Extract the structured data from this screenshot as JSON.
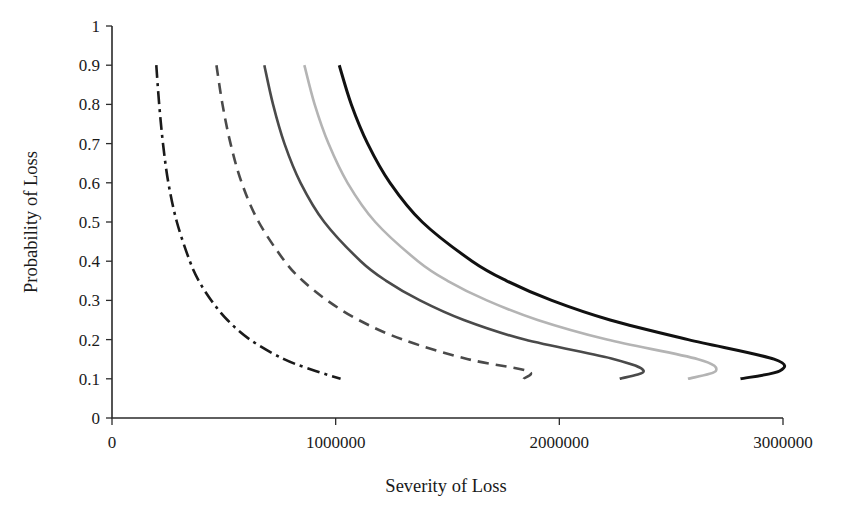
{
  "chart_data": {
    "type": "line",
    "title": "",
    "subtitle": "",
    "xlabel": "Severity of Loss",
    "ylabel": "Probability of Loss",
    "xlim": [
      0,
      3000000
    ],
    "ylim": [
      0,
      1
    ],
    "grid": false,
    "legend": "none",
    "x_ticks": [
      0,
      1000000,
      2000000,
      3000000
    ],
    "x_tick_labels": [
      "0",
      "1000000",
      "2000000",
      "3000000"
    ],
    "y_ticks": [
      0,
      0.1,
      0.2,
      0.3,
      0.4,
      0.5,
      0.6,
      0.7,
      0.8,
      0.9,
      1
    ],
    "y_tick_labels": [
      "0",
      "0.1",
      "0.2",
      "0.3",
      "0.4",
      "0.5",
      "0.6",
      "0.7",
      "0.8",
      "0.9",
      "1"
    ],
    "note": "Five iso-expected-loss curves: probability of loss decreasing hyperbolically with severity of loss. Each curve spans probability 0.9 down to 0.1.",
    "series": [
      {
        "name": "curve-1",
        "style": "dash-dot",
        "color": "#1a1a1a",
        "width": 2.6,
        "dasharray": "13,5,3,5",
        "probability": [
          0.9,
          0.8,
          0.7,
          0.6,
          0.5,
          0.4,
          0.35,
          0.3,
          0.25,
          0.2,
          0.15,
          0.12,
          0.1
        ],
        "severity": [
          198000,
          211000,
          228000,
          252000,
          290000,
          348000,
          388000,
          444000,
          516000,
          617000,
          769000,
          910000,
          1022000
        ]
      },
      {
        "name": "curve-2",
        "style": "dashed",
        "color": "#4a4a4a",
        "width": 2.6,
        "dasharray": "11,7",
        "probability": [
          0.9,
          0.8,
          0.7,
          0.6,
          0.5,
          0.4,
          0.35,
          0.3,
          0.25,
          0.2,
          0.15,
          0.12,
          0.1
        ],
        "severity": [
          467000,
          494000,
          530000,
          580000,
          656000,
          772000,
          853000,
          962000,
          1103000,
          1300000,
          1592000,
          1858000,
          1840000
        ]
      },
      {
        "name": "curve-3",
        "style": "solid",
        "color": "#4a4a4a",
        "width": 2.6,
        "dasharray": "none",
        "probability": [
          0.9,
          0.8,
          0.7,
          0.6,
          0.5,
          0.4,
          0.35,
          0.3,
          0.25,
          0.2,
          0.15,
          0.12,
          0.1
        ],
        "severity": [
          681000,
          720000,
          771000,
          843000,
          949000,
          1112000,
          1226000,
          1377000,
          1573000,
          1845000,
          2245000,
          2377000,
          2270000
        ]
      },
      {
        "name": "curve-4",
        "style": "solid",
        "color": "#b4b4b4",
        "width": 2.6,
        "dasharray": "none",
        "probability": [
          0.9,
          0.8,
          0.7,
          0.6,
          0.5,
          0.4,
          0.35,
          0.3,
          0.25,
          0.2,
          0.15,
          0.12,
          0.1
        ],
        "severity": [
          860000,
          906000,
          968000,
          1053000,
          1177000,
          1368000,
          1500000,
          1676000,
          1903000,
          2213000,
          2620000,
          2700000,
          2575000
        ]
      },
      {
        "name": "curve-5",
        "style": "solid",
        "color": "#111111",
        "width": 3.0,
        "dasharray": "none",
        "probability": [
          0.9,
          0.8,
          0.7,
          0.6,
          0.5,
          0.4,
          0.35,
          0.3,
          0.25,
          0.2,
          0.15,
          0.12,
          0.1
        ],
        "severity": [
          1016000,
          1070000,
          1143000,
          1243000,
          1387000,
          1610000,
          1764000,
          1966000,
          2227000,
          2576000,
          2960000,
          2985000,
          2810000
        ]
      }
    ]
  }
}
